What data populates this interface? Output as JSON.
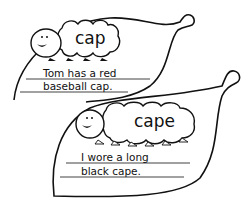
{
  "worksheet": {
    "cards": [
      {
        "word": "cap",
        "sentence_line1": "Tom has a red",
        "sentence_line2": "baseball cap."
      },
      {
        "word": "cape",
        "sentence_line1": "I wore a long",
        "sentence_line2": "black cape."
      }
    ],
    "colors": {
      "ink": "#111111",
      "paper": "#ffffff"
    }
  }
}
